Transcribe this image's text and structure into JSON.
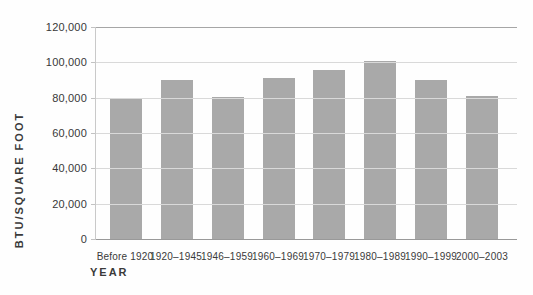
{
  "chart_data": {
    "type": "bar",
    "title": "",
    "xlabel": "YEAR",
    "ylabel": "BTU/SQUARE FOOT",
    "categories": [
      "Before 1920",
      "1920–1945",
      "1946–1959",
      "1960–1969",
      "1970–1979",
      "1980–1989",
      "1990–1999",
      "2000–2003"
    ],
    "values": [
      80000,
      90000,
      80500,
      91000,
      95500,
      101000,
      90000,
      81000
    ],
    "ylim": [
      0,
      120000
    ],
    "ytick_step": 20000,
    "ytick_labels": [
      "0",
      "20,000",
      "40,000",
      "60,000",
      "80,000",
      "100,000",
      "120,000"
    ],
    "grid": "horizontal",
    "legend": "none"
  },
  "colors": {
    "bar": "#a9a9a9",
    "gridline": "#d9d9d9",
    "top_frame_line": "#a6a6a6",
    "baseline": "#999999",
    "axis_line": "#c9c9c9",
    "text": "#3a3a3a",
    "background": "#fefefe"
  }
}
